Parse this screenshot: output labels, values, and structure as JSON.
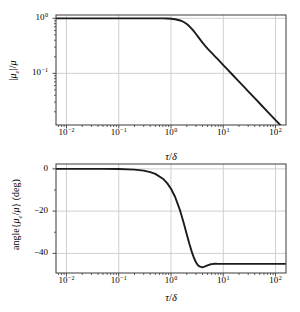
{
  "colors": {
    "curve": "#1c1c1c",
    "grid": "#c9c9c9",
    "spine": "#3a3a3a",
    "tick": "#3a3a3a",
    "text": "#000000",
    "background": "#ffffff"
  },
  "labels": {
    "top_ylabel_segs": [
      {
        "t": "|"
      },
      {
        "t": "μ",
        "i": 1
      },
      {
        "t": "e",
        "i": 1,
        "sub": 1
      },
      {
        "t": "|/"
      },
      {
        "t": "μ",
        "i": 1
      }
    ],
    "bottom_ylabel_segs": [
      {
        "t": "angle{"
      },
      {
        "t": "μ",
        "i": 1
      },
      {
        "t": "e",
        "i": 1,
        "sub": 1
      },
      {
        "t": "/"
      },
      {
        "t": "μ",
        "i": 1
      },
      {
        "t": "} (deg)"
      }
    ],
    "xlabel_segs": [
      {
        "t": "τ",
        "i": 1
      },
      {
        "t": "/"
      },
      {
        "t": "δ",
        "i": 1
      }
    ]
  },
  "chart_data": [
    {
      "id": "magnitude",
      "type": "line",
      "title": "",
      "xlabel": "τ/δ",
      "ylabel": "|μ_e|/μ",
      "xscale": "log",
      "yscale": "log",
      "xlim": [
        0.0063,
        158.5
      ],
      "ylim": [
        0.0115,
        1.15
      ],
      "grid": true,
      "legend": false,
      "xtick_exponents": [
        -2,
        -1,
        0,
        1,
        2
      ],
      "ytick_exponents": [
        0,
        -1
      ],
      "ygrid_values": [
        1,
        0.1
      ],
      "x": [
        0.0063,
        0.01,
        0.02,
        0.05,
        0.1,
        0.2,
        0.3,
        0.5,
        0.7,
        0.85,
        1.0,
        1.2,
        1.5,
        1.75,
        2.0,
        2.25,
        2.5,
        2.75,
        3.0,
        3.25,
        3.5,
        4.0,
        4.5,
        5.0,
        5.5,
        6.0,
        7.0,
        8.0,
        10,
        12,
        15,
        20,
        25,
        30,
        40,
        50,
        70,
        100,
        130,
        158
      ],
      "y": [
        1.0,
        1.0,
        1.0,
        1.0,
        1.0,
        0.9999,
        0.9997,
        0.999,
        0.997,
        0.993,
        0.981,
        0.962,
        0.915,
        0.858,
        0.79,
        0.717,
        0.645,
        0.579,
        0.52,
        0.47,
        0.428,
        0.362,
        0.316,
        0.282,
        0.256,
        0.235,
        0.202,
        0.177,
        0.1414,
        0.1179,
        0.0943,
        0.0707,
        0.0566,
        0.0471,
        0.0354,
        0.0283,
        0.0202,
        0.0141,
        0.0109,
        0.009
      ]
    },
    {
      "id": "phase",
      "type": "line",
      "title": "",
      "xlabel": "τ/δ",
      "ylabel": "angle{μ_e/μ} (deg)",
      "xscale": "log",
      "yscale": "linear",
      "xlim": [
        0.0063,
        158.5
      ],
      "ylim": [
        -49.3,
        2.3
      ],
      "grid": true,
      "legend": false,
      "xtick_exponents": [
        -2,
        -1,
        0,
        1,
        2
      ],
      "yticks": [
        0,
        -20,
        -40
      ],
      "ytick_labels": [
        "0",
        "−20",
        "−40"
      ],
      "yminor": [
        -10,
        -30
      ],
      "ygrid_values": [
        0,
        -20,
        -40
      ],
      "x": [
        0.0063,
        0.01,
        0.02,
        0.05,
        0.1,
        0.2,
        0.3,
        0.4,
        0.5,
        0.7,
        0.85,
        1.0,
        1.2,
        1.5,
        1.75,
        2.0,
        2.25,
        2.5,
        2.75,
        3.0,
        3.25,
        3.5,
        4.0,
        4.5,
        5.0,
        5.5,
        6.0,
        7.0,
        8.0,
        10,
        15,
        20,
        30,
        50,
        100,
        158
      ],
      "y": [
        0.0,
        0.0,
        0.0,
        -0.02,
        -0.1,
        -0.38,
        -0.86,
        -1.53,
        -2.39,
        -4.67,
        -6.87,
        -9.4,
        -13.3,
        -19.9,
        -25.6,
        -30.9,
        -35.6,
        -39.3,
        -42.2,
        -44.2,
        -45.5,
        -46.2,
        -46.6,
        -46.2,
        -45.7,
        -45.3,
        -45.1,
        -44.9,
        -45.0,
        -45.0,
        -45.0,
        -45.0,
        -45.0,
        -45.0,
        -45.0,
        -45.0
      ]
    }
  ]
}
